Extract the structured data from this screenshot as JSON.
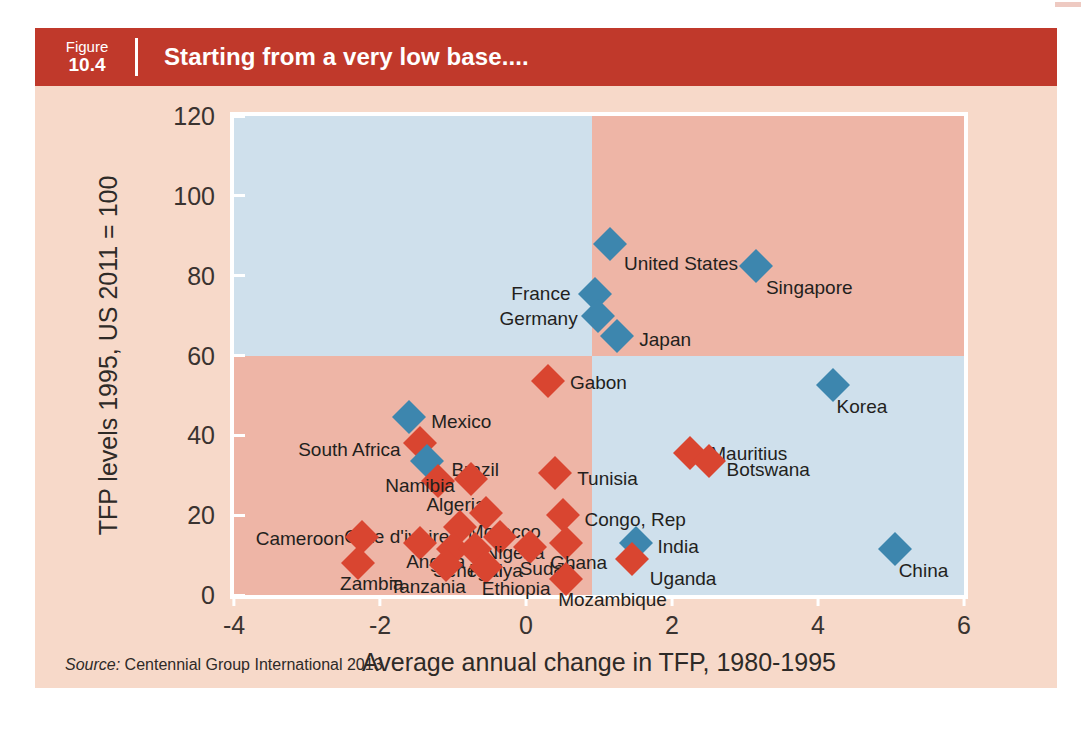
{
  "figure": {
    "number_label": "Figure",
    "number_value": "10.4",
    "title": "Starting from a very low base....",
    "source_prefix": "Source:",
    "source_text": "Centennial Group International 2013",
    "header_color": "#c0392b",
    "panel_background": "#f7d9c9"
  },
  "chart_data": {
    "type": "scatter",
    "title": "Starting from a very low base....",
    "xlabel": "Average annual change in TFP, 1980-1995",
    "ylabel": "TFP levels 1995, US 2011 = 100",
    "xlim": [
      -4,
      6
    ],
    "ylim": [
      0,
      120
    ],
    "xticks": [
      "-4",
      "-2",
      "0",
      "2",
      "4",
      "6"
    ],
    "xtick_values": [
      -4,
      -2,
      0,
      2,
      4,
      6
    ],
    "yticks": [
      "0",
      "20",
      "40",
      "60",
      "80",
      "100",
      "120"
    ],
    "ytick_values": [
      0,
      20,
      40,
      60,
      80,
      100,
      120
    ],
    "grid": false,
    "legend": "none",
    "quadrant_split": {
      "x": 0.9,
      "y": 60
    },
    "quadrant_colors": {
      "top_left": "#cfe0ec",
      "top_right": "#eeb5a6",
      "bottom_left": "#eeb5a6",
      "bottom_right": "#cfe0ec"
    },
    "marker_colors": {
      "red": "#d94530",
      "blue": "#3d86ae"
    },
    "points": [
      {
        "name": "United States",
        "x": 1.15,
        "y": 88,
        "color": "blue",
        "label_dx": 14,
        "label_dy": 20
      },
      {
        "name": "Singapore",
        "x": 3.15,
        "y": 82.5,
        "color": "blue",
        "label_dx": 10,
        "label_dy": 22
      },
      {
        "name": "France",
        "x": 0.95,
        "y": 75.5,
        "color": "blue",
        "label_dx": -84,
        "label_dy": 0
      },
      {
        "name": "Germany",
        "x": 0.98,
        "y": 70,
        "color": "blue",
        "label_dx": -98,
        "label_dy": 3
      },
      {
        "name": "Japan",
        "x": 1.25,
        "y": 65,
        "color": "blue",
        "label_dx": 22,
        "label_dy": 4
      },
      {
        "name": "Korea",
        "x": 4.2,
        "y": 52.5,
        "color": "blue",
        "label_dx": 4,
        "label_dy": 22
      },
      {
        "name": "Gabon",
        "x": 0.3,
        "y": 53.5,
        "color": "red",
        "label_dx": 22,
        "label_dy": 2
      },
      {
        "name": "Mexico",
        "x": -1.6,
        "y": 44.5,
        "color": "blue",
        "label_dx": 22,
        "label_dy": 5
      },
      {
        "name": "South Africa",
        "x": -1.45,
        "y": 38,
        "color": "red",
        "label_dx": -122,
        "label_dy": 7
      },
      {
        "name": "Brazil",
        "x": -1.35,
        "y": 33.5,
        "color": "blue",
        "label_dx": 24,
        "label_dy": 9
      },
      {
        "name": "Algeria",
        "x": -1.2,
        "y": 28.5,
        "color": "red",
        "label_dx": -12,
        "label_dy": 24
      },
      {
        "name": "Namibia",
        "x": -0.75,
        "y": 29,
        "color": "red",
        "label_dx": -86,
        "label_dy": 7
      },
      {
        "name": "Tunisia",
        "x": 0.4,
        "y": 30.5,
        "color": "red",
        "label_dx": 22,
        "label_dy": 6
      },
      {
        "name": "Morocco",
        "x": -0.55,
        "y": 20.5,
        "color": "red",
        "label_dx": -18,
        "label_dy": 19
      },
      {
        "name": "Cote d'ivoire",
        "x": -0.9,
        "y": 17,
        "color": "red",
        "label_dx": -116,
        "label_dy": 10
      },
      {
        "name": "Congo, Rep",
        "x": 0.5,
        "y": 20,
        "color": "red",
        "label_dx": 22,
        "label_dy": 5
      },
      {
        "name": "Nigeria",
        "x": -0.35,
        "y": 14.5,
        "color": "red",
        "label_dx": -16,
        "label_dy": 16
      },
      {
        "name": "Cameroon",
        "x": -2.25,
        "y": 14.5,
        "color": "red",
        "label_dx": -106,
        "label_dy": 2
      },
      {
        "name": "Angola",
        "x": -1.45,
        "y": 13,
        "color": "red",
        "label_dx": -14,
        "label_dy": 19
      },
      {
        "name": "Senegal",
        "x": -1.0,
        "y": 11.5,
        "color": "red",
        "label_dx": -20,
        "label_dy": 22
      },
      {
        "name": "Kenya",
        "x": -0.7,
        "y": 11.5,
        "color": "red",
        "label_dx": -6,
        "label_dy": 22
      },
      {
        "name": "Sudan",
        "x": 0.05,
        "y": 12,
        "color": "red",
        "label_dx": -10,
        "label_dy": 22
      },
      {
        "name": "Ghana",
        "x": 0.55,
        "y": 13,
        "color": "red",
        "label_dx": -16,
        "label_dy": 20
      },
      {
        "name": "India",
        "x": 1.5,
        "y": 13,
        "color": "blue",
        "label_dx": 22,
        "label_dy": 4
      },
      {
        "name": "China",
        "x": 5.05,
        "y": 11.5,
        "color": "blue",
        "label_dx": 4,
        "label_dy": 22
      },
      {
        "name": "Mauritius",
        "x": 2.25,
        "y": 35.5,
        "color": "red",
        "label_dx": 20,
        "label_dy": 1
      },
      {
        "name": "Botswana",
        "x": 2.5,
        "y": 33.5,
        "color": "red",
        "label_dx": 18,
        "label_dy": 9
      },
      {
        "name": "Zambia",
        "x": -2.3,
        "y": 8,
        "color": "red",
        "label_dx": -18,
        "label_dy": 21
      },
      {
        "name": "Tanzania",
        "x": -1.1,
        "y": 7.5,
        "color": "red",
        "label_dx": -56,
        "label_dy": 22
      },
      {
        "name": "Ethiopia",
        "x": -0.55,
        "y": 7,
        "color": "red",
        "label_dx": -4,
        "label_dy": 22
      },
      {
        "name": "Uganda",
        "x": 1.45,
        "y": 9,
        "color": "red",
        "label_dx": 18,
        "label_dy": 20
      },
      {
        "name": "Mozambique",
        "x": 0.55,
        "y": 4,
        "color": "red",
        "label_dx": -8,
        "label_dy": 21
      }
    ]
  }
}
